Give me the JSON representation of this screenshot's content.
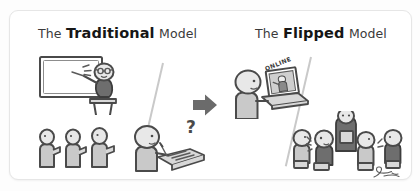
{
  "illustration": {
    "alt_title": "Traditional vs Flipped classroom model comparison",
    "panels": [
      {
        "id": "traditional",
        "title_prefix": "The",
        "title_emphasis": "Traditional",
        "title_suffix": "Model",
        "scenes": [
          {
            "name": "teacher-lecturing-at-whiteboard",
            "icon": "whiteboard-icon"
          },
          {
            "name": "students-seated-in-row",
            "icon": "students-row-icon"
          },
          {
            "name": "confused-student-doing-homework",
            "icon": "question-mark-icon",
            "annotation": "?"
          }
        ]
      },
      {
        "id": "flipped",
        "title_prefix": "The",
        "title_emphasis": "Flipped",
        "title_suffix": "Model",
        "scenes": [
          {
            "name": "student-watching-online-lecture",
            "icon": "laptop-icon",
            "annotation": "ONLINE"
          },
          {
            "name": "students-collaborating-with-teacher",
            "icon": "group-work-icon"
          }
        ]
      }
    ],
    "transition_arrow": {
      "name": "right-arrow",
      "direction": "right"
    },
    "signature": {
      "name": "artist-signature",
      "text": "S"
    },
    "colors": {
      "page_background": "#fdfdfd",
      "card_background": "#ffffff",
      "card_border": "#e6e6e6",
      "ink": "#4a4a4a",
      "title_bold": "#161616",
      "title_light": "#3a3a3a",
      "arrow": "#6b6b6b",
      "divider": "#c9c9c9"
    }
  }
}
